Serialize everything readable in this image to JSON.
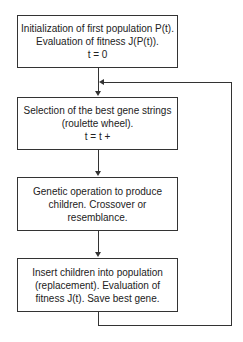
{
  "flowchart": {
    "steps": [
      {
        "lines": [
          "Initialization of first population P(t).",
          "Evaluation of fitness J(P(t)).",
          "t = 0"
        ]
      },
      {
        "lines": [
          "Selection of the best gene strings",
          "(roulette wheel).",
          "t = t +"
        ]
      },
      {
        "lines": [
          "Genetic operation to produce",
          "children. Crossover or",
          "resemblance."
        ]
      },
      {
        "lines": [
          "Insert children into population",
          "(replacement). Evaluation of",
          "fitness J(t). Save best gene."
        ]
      }
    ],
    "loop": {
      "from": "step-4",
      "to": "step-2"
    },
    "colors": {
      "stroke": "#333333",
      "background": "#ffffff"
    }
  }
}
